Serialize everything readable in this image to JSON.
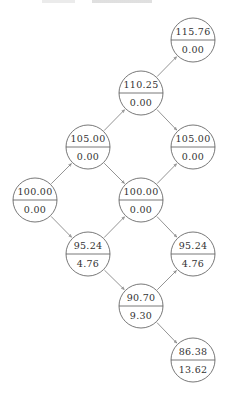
{
  "diagram": {
    "type": "binomial-tree",
    "node_radius": 22,
    "colors": {
      "stroke": "#555555",
      "edge": "#666666",
      "text": "#333333",
      "background": "#ffffff"
    },
    "nodes": [
      {
        "id": "n0",
        "x": 35,
        "y": 200,
        "top": "100.00",
        "bottom": "0.00"
      },
      {
        "id": "n1",
        "x": 88,
        "y": 147,
        "top": "105.00",
        "bottom": "0.00"
      },
      {
        "id": "n2",
        "x": 88,
        "y": 254,
        "top": "95.24",
        "bottom": "4.76"
      },
      {
        "id": "n3",
        "x": 141,
        "y": 93,
        "top": "110.25",
        "bottom": "0.00"
      },
      {
        "id": "n4",
        "x": 141,
        "y": 200,
        "top": "100.00",
        "bottom": "0.00"
      },
      {
        "id": "n5",
        "x": 141,
        "y": 306,
        "top": "90.70",
        "bottom": "9.30"
      },
      {
        "id": "n6",
        "x": 193,
        "y": 40,
        "top": "115.76",
        "bottom": "0.00"
      },
      {
        "id": "n7",
        "x": 193,
        "y": 147,
        "top": "105.00",
        "bottom": "0.00"
      },
      {
        "id": "n8",
        "x": 193,
        "y": 254,
        "top": "95.24",
        "bottom": "4.76"
      },
      {
        "id": "n9",
        "x": 193,
        "y": 360,
        "top": "86.38",
        "bottom": "13.62"
      }
    ],
    "edges": [
      [
        "n0",
        "n1"
      ],
      [
        "n0",
        "n2"
      ],
      [
        "n1",
        "n3"
      ],
      [
        "n1",
        "n4"
      ],
      [
        "n2",
        "n4"
      ],
      [
        "n2",
        "n5"
      ],
      [
        "n3",
        "n6"
      ],
      [
        "n3",
        "n7"
      ],
      [
        "n4",
        "n7"
      ],
      [
        "n4",
        "n8"
      ],
      [
        "n5",
        "n8"
      ],
      [
        "n5",
        "n9"
      ]
    ]
  }
}
